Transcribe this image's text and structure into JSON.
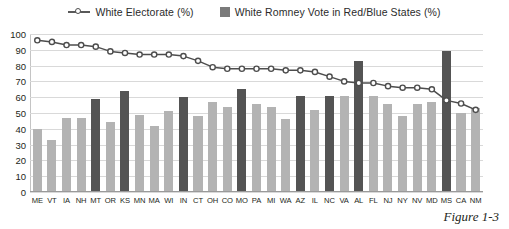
{
  "chart_data": {
    "type": "bar",
    "title": "",
    "subtitle": "",
    "xlabel": "",
    "ylabel": "",
    "ylim": [
      0,
      100
    ],
    "ytick_step": 10,
    "yticks": [
      100,
      90,
      80,
      70,
      60,
      50,
      40,
      30,
      20,
      10,
      0
    ],
    "grid": true,
    "legend_position": "top-center",
    "categories": [
      "ME",
      "VT",
      "IA",
      "NH",
      "MT",
      "OR",
      "KS",
      "MN",
      "MA",
      "WI",
      "IN",
      "CT",
      "OH",
      "CO",
      "MO",
      "PA",
      "MI",
      "WA",
      "AZ",
      "IL",
      "NC",
      "VA",
      "AL",
      "FL",
      "NJ",
      "NY",
      "NV",
      "MD",
      "MS",
      "CA",
      "NM"
    ],
    "series": [
      {
        "name": "White Electorate  (%)",
        "type": "line",
        "marker": "open-circle",
        "color": "#4d4d4d",
        "values": [
          96,
          95,
          93,
          93,
          92,
          89,
          88,
          87,
          87,
          87,
          86,
          83,
          79,
          78,
          78,
          78,
          78,
          77,
          77,
          76,
          73,
          70,
          69,
          69,
          67,
          66,
          66,
          65,
          58,
          56,
          52
        ]
      },
      {
        "name": "White Romney Vote in Red/Blue States (%)",
        "type": "bar",
        "values": [
          40,
          33,
          47,
          47,
          59,
          44,
          64,
          49,
          42,
          51,
          60,
          48,
          57,
          54,
          65,
          56,
          54,
          46,
          61,
          52,
          61,
          61,
          83,
          61,
          56,
          48,
          56,
          57,
          89,
          50,
          53
        ],
        "state_type": [
          "blue",
          "blue",
          "blue",
          "blue",
          "red",
          "blue",
          "red",
          "blue",
          "blue",
          "blue",
          "red",
          "blue",
          "blue",
          "blue",
          "red",
          "blue",
          "blue",
          "blue",
          "red",
          "blue",
          "red",
          "blue",
          "red",
          "blue",
          "blue",
          "blue",
          "blue",
          "blue",
          "red",
          "blue",
          "blue"
        ],
        "colors": {
          "red": "#545454",
          "blue": "#b3b3b3"
        }
      }
    ]
  },
  "legend": {
    "items": [
      {
        "label": "White Electorate  (%)",
        "marker": "line-open-circle-marker"
      },
      {
        "label": "White Romney Vote in Red/Blue States (%)",
        "marker": "bar-swatch"
      }
    ]
  },
  "caption": {
    "text": "Figure 1-3"
  }
}
